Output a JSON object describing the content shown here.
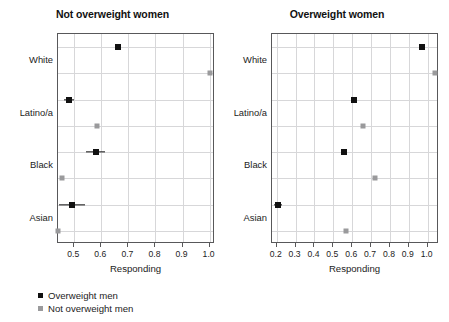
{
  "colors": {
    "overweight_men": "#111111",
    "not_overweight_men": "#9a9a9c",
    "frame": "#58585a",
    "grid": "#d7d7d9",
    "background": "#ffffff"
  },
  "legend": {
    "position": "below-left-panel",
    "entries": [
      {
        "label": "Overweight men",
        "color": "#111111",
        "marker": "square"
      },
      {
        "label": "Not overweight men",
        "color": "#9a9a9c",
        "marker": "square"
      }
    ]
  },
  "chart_data": [
    {
      "type": "scatter",
      "title": "Not overweight women",
      "xlabel": "Responding",
      "ylabel": "",
      "categories": [
        "White",
        "Latino/a",
        "Black",
        "Asian"
      ],
      "xlim": [
        0.44,
        1.02
      ],
      "xticks": [
        0.5,
        0.6,
        0.7,
        0.8,
        0.9,
        1.0
      ],
      "xticklabels": [
        "0.5",
        "0.6",
        "0.7",
        "0.8",
        "0.9",
        "1.0"
      ],
      "grid": true,
      "series": [
        {
          "name": "Overweight men",
          "color": "#111111",
          "values": [
            0.66,
            0.48,
            0.58,
            0.49
          ],
          "errors": [
            0.0,
            0.018,
            0.035,
            0.048
          ]
        },
        {
          "name": "Not overweight men",
          "color": "#9a9a9c",
          "values": [
            1.0,
            0.585,
            0.455,
            0.44
          ],
          "errors": [
            0.0,
            0.0,
            0.0,
            0.0
          ]
        }
      ]
    },
    {
      "type": "scatter",
      "title": "Overweight women",
      "xlabel": "Responding",
      "ylabel": "",
      "categories": [
        "White",
        "Latino/a",
        "Black",
        "Asian"
      ],
      "xlim": [
        0.175,
        1.06
      ],
      "xticks": [
        0.2,
        0.3,
        0.4,
        0.5,
        0.6,
        0.7,
        0.8,
        0.9,
        1.0
      ],
      "xticklabels": [
        "0.2",
        "0.3",
        "0.4",
        "0.5",
        "0.6",
        "0.7",
        "0.8",
        "0.9",
        "1.0"
      ],
      "grid": true,
      "series": [
        {
          "name": "Overweight men",
          "color": "#111111",
          "values": [
            0.97,
            0.61,
            0.555,
            0.205
          ],
          "errors": [
            0.0,
            0.012,
            0.01,
            0.022
          ]
        },
        {
          "name": "Not overweight men",
          "color": "#9a9a9c",
          "values": [
            1.04,
            0.655,
            0.72,
            0.565
          ],
          "errors": [
            0.0,
            0.0,
            0.0,
            0.0
          ]
        }
      ]
    }
  ]
}
